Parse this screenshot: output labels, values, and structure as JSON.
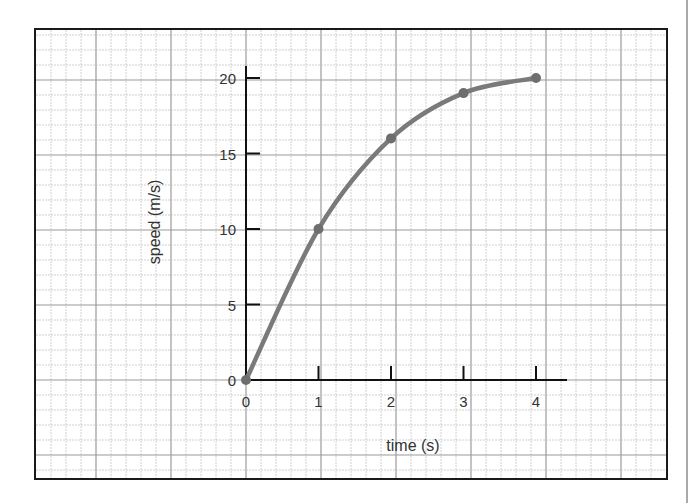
{
  "chart_data": {
    "type": "line",
    "title": "",
    "xlabel": "time (s)",
    "ylabel": "speed (m/s)",
    "x": [
      0,
      1,
      2,
      3,
      4
    ],
    "series": [
      {
        "name": "speed",
        "values": [
          0,
          10,
          16,
          19,
          20
        ],
        "color": "#7a7a7a",
        "markers": true,
        "smooth": true
      }
    ],
    "xticks": [
      0,
      1,
      2,
      3,
      4
    ],
    "yticks": [
      0,
      5,
      10,
      15,
      20
    ],
    "xlim": [
      0,
      4.4
    ],
    "ylim": [
      0,
      20
    ],
    "grid": "graph-paper",
    "legend": null
  },
  "style": {
    "curve_color": "#7a7a7a",
    "axis_color": "#111111",
    "grid_major_color": "#9a9a9a",
    "grid_minor_color": "#c4c4c4",
    "border_color": "#1a1a1a"
  }
}
